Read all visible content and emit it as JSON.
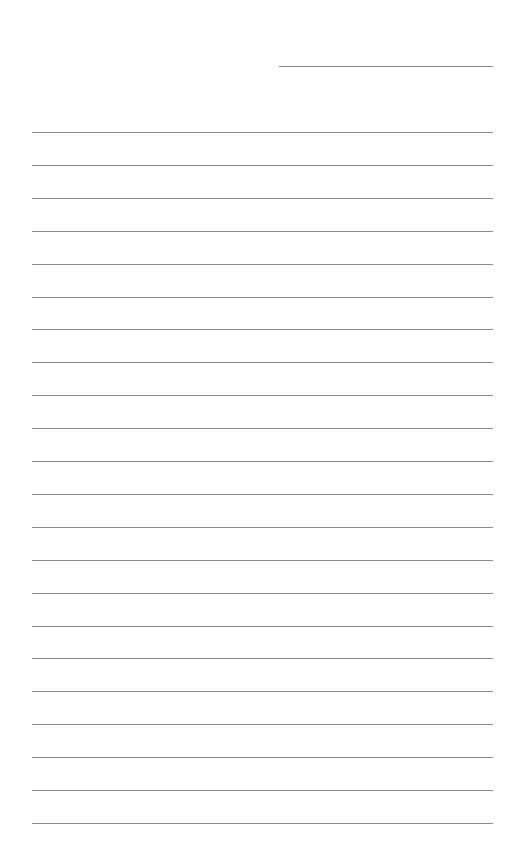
{
  "document": {
    "type": "lined-paper",
    "header_line": {
      "x": 279,
      "y": 66,
      "width": 214
    },
    "rules": {
      "count": 22,
      "x": 32,
      "width": 461,
      "first_y": 132,
      "spacing": 32.9
    },
    "colors": {
      "background": "#ffffff",
      "line": "#8a8a8a"
    }
  }
}
